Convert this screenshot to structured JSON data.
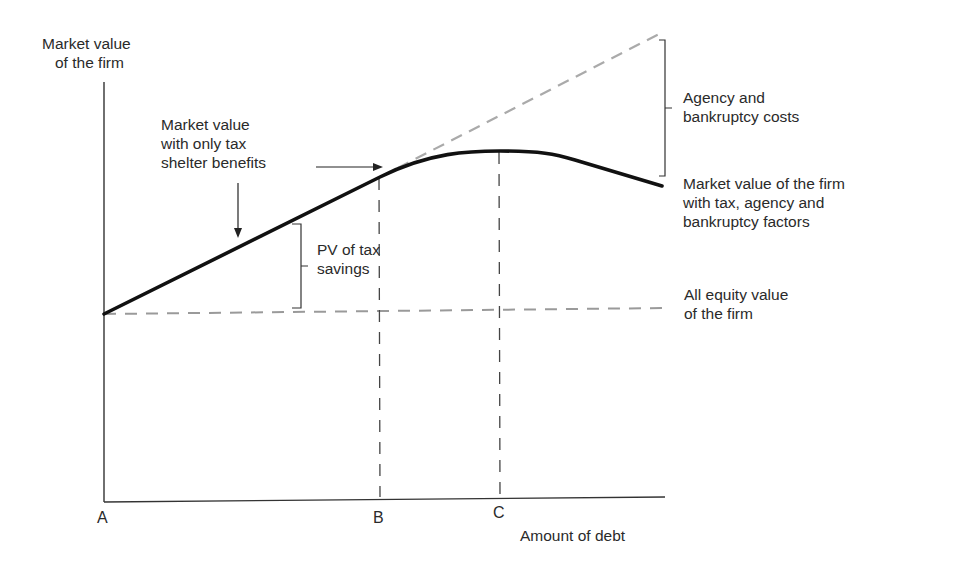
{
  "diagram": {
    "y_axis_label": [
      "Market value",
      "of the firm"
    ],
    "x_axis_label": "Amount of debt",
    "points": {
      "a": "A",
      "b": "B",
      "c": "C"
    },
    "annotations": {
      "tax_only": [
        "Market value",
        "with only tax",
        "shelter benefits"
      ],
      "pv_tax": [
        "PV of tax",
        "savings"
      ],
      "agency": [
        "Agency and",
        "bankruptcy costs"
      ],
      "combined": [
        "Market value of the firm",
        "with tax, agency and",
        "bankruptcy factors"
      ],
      "all_equity": [
        "All equity value",
        "of the firm"
      ]
    },
    "colors": {
      "curve": "#111111",
      "axis": "#333333",
      "gray_dash": "#a8a8a8",
      "dark_dash": "#444444"
    }
  }
}
